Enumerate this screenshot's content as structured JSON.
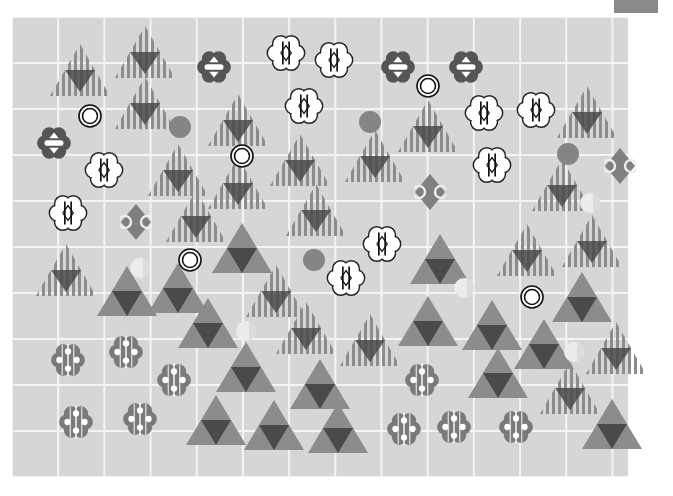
{
  "board": {
    "columns": 13,
    "rows": 10,
    "background": "#d6d6d6",
    "grid_line_color": "#f4f4f4"
  },
  "colors": {
    "triangle_light": "#8c8c8c",
    "triangle_dark": "#4a4a4a",
    "flower_dark": "#555555",
    "blob": "#7a7a7a",
    "solid_circle": "#858585",
    "diamond": "#808080",
    "pale_disc": "#ececec"
  },
  "pieces": {
    "striped_triangles": [
      [
        80,
        70
      ],
      [
        145,
        52
      ],
      [
        145,
        103
      ],
      [
        238,
        120
      ],
      [
        178,
        170
      ],
      [
        238,
        183
      ],
      [
        300,
        160
      ],
      [
        375,
        156
      ],
      [
        428,
        126
      ],
      [
        587,
        112
      ],
      [
        562,
        185
      ],
      [
        196,
        216
      ],
      [
        316,
        210
      ],
      [
        66,
        270
      ],
      [
        276,
        291
      ],
      [
        306,
        328
      ],
      [
        370,
        340
      ],
      [
        527,
        250
      ],
      [
        592,
        241
      ],
      [
        616,
        348
      ],
      [
        570,
        388
      ]
    ],
    "solid_triangles": [
      [
        127,
        290
      ],
      [
        178,
        287
      ],
      [
        242,
        247
      ],
      [
        208,
        322
      ],
      [
        440,
        258
      ],
      [
        428,
        320
      ],
      [
        492,
        324
      ],
      [
        544,
        343
      ],
      [
        582,
        296
      ],
      [
        246,
        366
      ],
      [
        320,
        383
      ],
      [
        498,
        372
      ],
      [
        216,
        419
      ],
      [
        274,
        424
      ],
      [
        338,
        427
      ],
      [
        612,
        423
      ]
    ],
    "white_flowers": [
      [
        286,
        53
      ],
      [
        334,
        60
      ],
      [
        304,
        106
      ],
      [
        104,
        170
      ],
      [
        68,
        213
      ],
      [
        484,
        113
      ],
      [
        536,
        110
      ],
      [
        492,
        165
      ],
      [
        382,
        244
      ],
      [
        346,
        278
      ]
    ],
    "dark_flowers": [
      [
        214,
        67
      ],
      [
        398,
        67
      ],
      [
        466,
        67
      ],
      [
        54,
        143
      ]
    ],
    "dotted_blobs": [
      [
        68,
        360
      ],
      [
        126,
        352
      ],
      [
        174,
        380
      ],
      [
        76,
        422
      ],
      [
        140,
        419
      ],
      [
        422,
        380
      ],
      [
        404,
        429
      ],
      [
        454,
        427
      ],
      [
        516,
        427
      ]
    ],
    "ring_circles": [
      [
        90,
        116
      ],
      [
        242,
        156
      ],
      [
        428,
        86
      ],
      [
        190,
        260
      ],
      [
        532,
        297
      ]
    ],
    "solid_circles": [
      [
        180,
        127
      ],
      [
        370,
        122
      ],
      [
        568,
        154
      ],
      [
        314,
        260
      ]
    ],
    "diamonds": [
      [
        136,
        222
      ],
      [
        430,
        192
      ],
      [
        620,
        166
      ]
    ],
    "pale_discs": [
      [
        140,
        268
      ],
      [
        246,
        331
      ],
      [
        464,
        288
      ],
      [
        590,
        203
      ],
      [
        574,
        352
      ]
    ]
  }
}
